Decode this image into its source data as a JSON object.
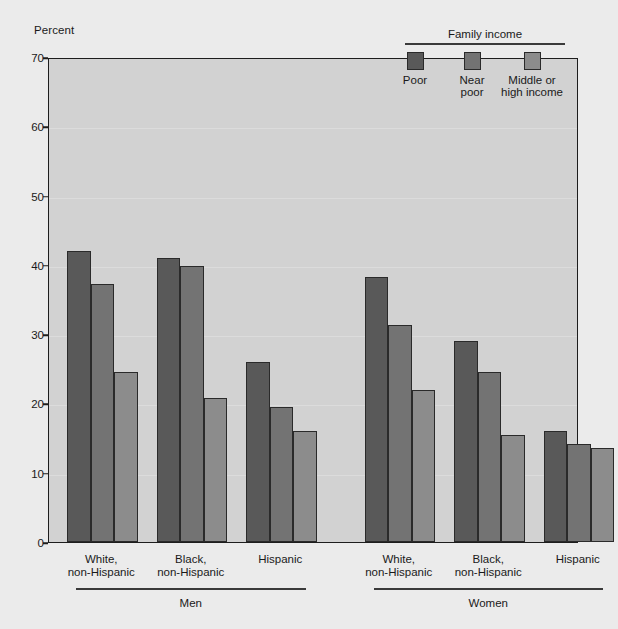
{
  "chart_data": {
    "type": "bar",
    "title": "",
    "ylabel": "Percent",
    "xlabel": "",
    "ylim": [
      0,
      70
    ],
    "yticks": [
      0,
      10,
      20,
      30,
      40,
      50,
      60,
      70
    ],
    "grid": true,
    "legend": {
      "title": "Family income",
      "position": "top-right",
      "entries": [
        {
          "name": "Poor",
          "color": "#595959"
        },
        {
          "name": "Near\npoor",
          "color": "#737373"
        },
        {
          "name": "Middle or\nhigh income",
          "color": "#8c8c8c"
        }
      ]
    },
    "panels": [
      {
        "name": "Men",
        "categories": [
          "White,\nnon-Hispanic",
          "Black,\nnon-Hispanic",
          "Hispanic"
        ],
        "series": [
          {
            "name": "Poor",
            "values": [
              42.0,
              41.0,
              26.0
            ]
          },
          {
            "name": "Near poor",
            "values": [
              37.3,
              39.8,
              19.5
            ]
          },
          {
            "name": "Middle or high income",
            "values": [
              24.5,
              20.8,
              16.0
            ]
          }
        ]
      },
      {
        "name": "Women",
        "categories": [
          "White,\nnon-Hispanic",
          "Black,\nnon-Hispanic",
          "Hispanic"
        ],
        "series": [
          {
            "name": "Poor",
            "values": [
              38.3,
              29.0,
              16.0
            ]
          },
          {
            "name": "Near poor",
            "values": [
              31.3,
              24.5,
              14.2
            ]
          },
          {
            "name": "Middle or high income",
            "values": [
              22.0,
              15.4,
              13.5
            ]
          }
        ]
      }
    ],
    "colors": {
      "poor": "#595959",
      "near_poor": "#737373",
      "middle_or_high": "#8c8c8c",
      "plot_background": "#d2d2d2",
      "page_background": "#ebebeb",
      "axis": "#1d1d1d",
      "gridline": "#dcdcdc"
    }
  }
}
